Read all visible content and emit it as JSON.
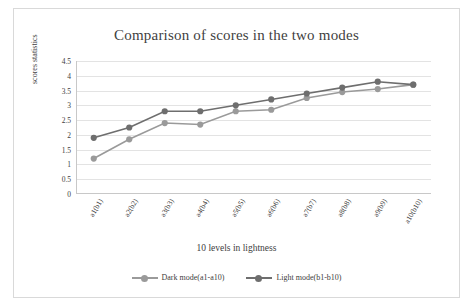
{
  "chart_data": {
    "type": "line",
    "title": "Comparison of scores in the two modes",
    "xlabel": "10 levels in lightness",
    "ylabel": "scores statistics",
    "categories": [
      "a1(b1)",
      "a2(b2)",
      "a3(b3)",
      "a4(b4)",
      "a5(b5)",
      "a6(b6)",
      "a7(b7)",
      "a8(b8)",
      "a9(b9)",
      "a10(b10)"
    ],
    "ylim": [
      0,
      4.5
    ],
    "yticks": [
      "0",
      "0.5",
      "1",
      "1.5",
      "2",
      "2.5",
      "3",
      "3.5",
      "4",
      "4.5"
    ],
    "ytick_values": [
      0,
      0.5,
      1,
      1.5,
      2,
      2.5,
      3,
      3.5,
      4,
      4.5
    ],
    "grid": true,
    "legend_position": "bottom",
    "series": [
      {
        "name": "Dark mode(a1-a10)",
        "color": "#9a9a9a",
        "values": [
          1.2,
          1.85,
          2.4,
          2.35,
          2.8,
          2.85,
          3.25,
          3.45,
          3.55,
          3.7
        ]
      },
      {
        "name": "Light mode(b1-b10)",
        "color": "#6e6e6e",
        "values": [
          1.9,
          2.25,
          2.8,
          2.8,
          3.0,
          3.2,
          3.4,
          3.6,
          3.8,
          3.7
        ]
      }
    ]
  }
}
